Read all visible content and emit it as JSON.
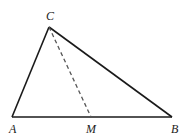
{
  "diagram": {
    "type": "triangle-with-median",
    "points": {
      "A": {
        "label": "A",
        "x": 12,
        "y": 117
      },
      "B": {
        "label": "B",
        "x": 172,
        "y": 117
      },
      "C": {
        "label": "C",
        "x": 49,
        "y": 27
      },
      "M": {
        "label": "M",
        "x": 91,
        "y": 117
      }
    },
    "segments": [
      {
        "from": "A",
        "to": "B",
        "style": "solid"
      },
      {
        "from": "A",
        "to": "C",
        "style": "solid"
      },
      {
        "from": "B",
        "to": "C",
        "style": "solid"
      },
      {
        "from": "C",
        "to": "M",
        "style": "dashed"
      }
    ],
    "colors": {
      "line": "#1a1a1a",
      "dashed": "#555555"
    }
  }
}
